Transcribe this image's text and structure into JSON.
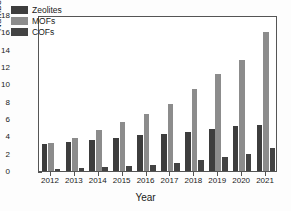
{
  "chart_data": {
    "type": "bar",
    "title": "",
    "xlabel": "Year",
    "ylabel": "Number of papers (× 10⁵)",
    "categories": [
      "2012",
      "2013",
      "2014",
      "2015",
      "2016",
      "2017",
      "2018",
      "2019",
      "2020",
      "2021"
    ],
    "series": [
      {
        "name": "Zeolites",
        "color": "#3d3d3d",
        "values": [
          3.1,
          3.3,
          3.6,
          3.8,
          4.1,
          4.3,
          4.5,
          4.85,
          5.2,
          5.3
        ]
      },
      {
        "name": "MOFs",
        "color": "#8c8c8c",
        "values": [
          3.2,
          3.8,
          4.7,
          5.65,
          6.55,
          7.7,
          9.45,
          11.2,
          12.8,
          16.05
        ]
      },
      {
        "name": "COFs",
        "color": "#434343",
        "values": [
          0.25,
          0.35,
          0.45,
          0.55,
          0.75,
          0.95,
          1.3,
          1.6,
          1.95,
          2.65
        ]
      }
    ],
    "ylim": [
      0,
      18
    ],
    "yticks": [
      0,
      2,
      4,
      6,
      8,
      10,
      12,
      14,
      16,
      18
    ],
    "ytick_labels": [
      "0",
      "2",
      "4",
      "6",
      "8",
      "10",
      "12",
      "14",
      "16",
      "18"
    ],
    "grid": false,
    "legend_position": "upper-left",
    "frame": "box",
    "axis_color": "#555555",
    "background": "#ffffff"
  }
}
